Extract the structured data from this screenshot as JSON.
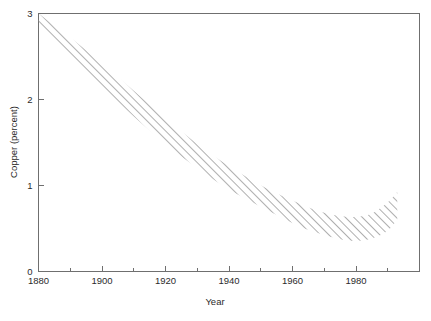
{
  "chart_data": {
    "type": "area",
    "title": "",
    "subtitle": "",
    "xlabel": "Year",
    "ylabel": "Copper (percent)",
    "xlim": [
      1880,
      2000
    ],
    "ylim": [
      0,
      3
    ],
    "grid": false,
    "legend": null,
    "annotations": [],
    "x_major_ticks": [
      1880,
      1900,
      1920,
      1940,
      1960,
      1980
    ],
    "x_major_tick_labels": [
      "1880",
      "1900",
      "1920",
      "1940",
      "1960",
      "1980"
    ],
    "x_minor_ticks": [
      1890,
      1910,
      1930,
      1950,
      1970,
      1990
    ],
    "y_major_ticks": [
      0,
      1,
      2,
      3
    ],
    "y_major_tick_labels": [
      "0",
      "1",
      "2",
      "3"
    ],
    "band_style": "diagonal-hatch",
    "band_color": "#9a9a9a",
    "series": [
      {
        "name": "Copper ore grade upper bound",
        "x": [
          1880,
          1890,
          1900,
          1910,
          1920,
          1930,
          1940,
          1950,
          1960,
          1965,
          1970,
          1975,
          1980,
          1985,
          1990,
          1993
        ],
        "values": [
          3.0,
          2.72,
          2.42,
          2.1,
          1.78,
          1.48,
          1.22,
          1.0,
          0.82,
          0.74,
          0.68,
          0.64,
          0.63,
          0.67,
          0.8,
          0.92
        ]
      },
      {
        "name": "Copper ore grade lower bound",
        "x": [
          1880,
          1890,
          1900,
          1910,
          1920,
          1930,
          1940,
          1950,
          1960,
          1965,
          1970,
          1975,
          1980,
          1985,
          1990,
          1993
        ],
        "values": [
          2.84,
          2.5,
          2.15,
          1.8,
          1.48,
          1.2,
          0.95,
          0.75,
          0.56,
          0.48,
          0.42,
          0.37,
          0.35,
          0.38,
          0.47,
          0.6
        ]
      }
    ]
  },
  "axes": {
    "y_title": "Copper (percent)",
    "x_title": "Year"
  }
}
